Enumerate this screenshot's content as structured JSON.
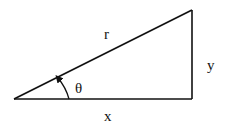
{
  "diagram": {
    "type": "right-triangle",
    "labels": {
      "hypotenuse": "r",
      "opposite": "y",
      "adjacent": "x",
      "angle": "θ"
    },
    "stroke_color": "#111111"
  }
}
